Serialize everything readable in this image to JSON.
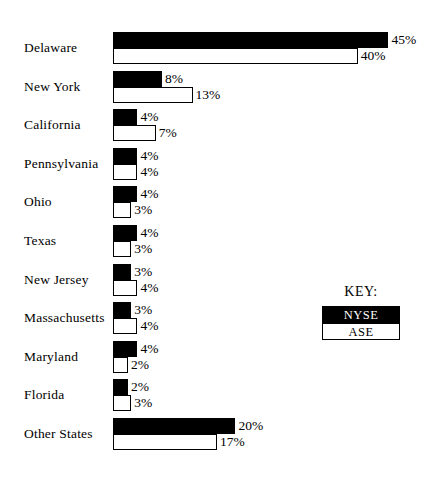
{
  "chart_data": {
    "type": "bar",
    "orientation": "horizontal",
    "title": "",
    "subtitle": "",
    "xlabel": "",
    "ylabel": "",
    "grid": false,
    "axis_visible": false,
    "value_suffix": "%",
    "xlim": [
      0,
      45
    ],
    "categories": [
      "Delaware",
      "New York",
      "California",
      "Pennsylvania",
      "Ohio",
      "Texas",
      "New Jersey",
      "Massachusetts",
      "Maryland",
      "Florida",
      "Other States"
    ],
    "series": [
      {
        "name": "NYSE",
        "color": "#000000",
        "values": [
          45,
          8,
          4,
          4,
          4,
          4,
          3,
          3,
          4,
          2,
          20
        ],
        "labels": [
          "45%",
          "8%",
          "4%",
          "4%",
          "4%",
          "4%",
          "3%",
          "3%",
          "4%",
          "2%",
          "20%"
        ]
      },
      {
        "name": "ASE",
        "color": "#ffffff",
        "values": [
          40,
          13,
          7,
          4,
          3,
          3,
          4,
          4,
          2,
          3,
          17
        ],
        "labels": [
          "40%",
          "13%",
          "7%",
          "4%",
          "3%",
          "3%",
          "4%",
          "4%",
          "2%",
          "3%",
          "17%"
        ]
      }
    ],
    "legend": {
      "position": "right-middle",
      "title": "KEY:",
      "entries": [
        {
          "label": "NYSE",
          "swatch": "black",
          "text_color": "#ffffff"
        },
        {
          "label": "ASE",
          "swatch": "white",
          "text_color": "#000000"
        }
      ]
    }
  }
}
